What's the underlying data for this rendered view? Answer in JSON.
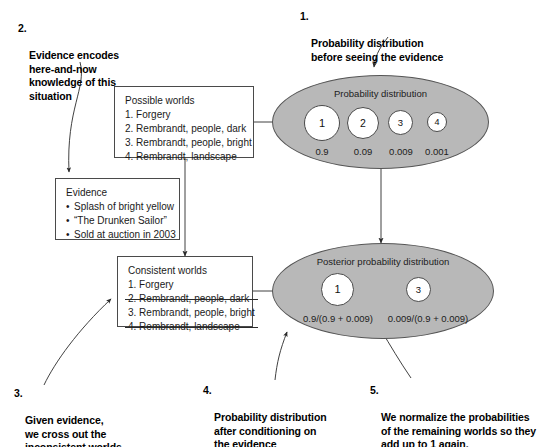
{
  "captions": {
    "c1": {
      "num": "1.",
      "text": "Probability distribution\nbefore seeing the evidence"
    },
    "c2": {
      "num": "2.",
      "text": "Evidence encodes\nhere-and-now\nknowledge of this\nsituation"
    },
    "c3": {
      "num": "3.",
      "text": "Given evidence,\nwe cross out the\ninconsistent worlds."
    },
    "c4": {
      "num": "4.",
      "text": "Probability distribution\nafter conditioning on\nthe evidence"
    },
    "c5": {
      "num": "5.",
      "text": "We normalize the probabilities\nof the remaining worlds so they\nadd up to 1 again."
    }
  },
  "possible_worlds_box": {
    "title": "Possible worlds",
    "items": [
      "1. Forgery",
      "2. Rembrandt, people, dark",
      "3. Rembrandt, people, bright",
      "4. Rembrandt, landscape"
    ]
  },
  "evidence_box": {
    "title": "Evidence",
    "bullet": "•",
    "items": [
      "Splash of bright yellow",
      "“The Drunken Sailor”",
      "Sold at auction in 2003"
    ]
  },
  "consistent_worlds_box": {
    "title": "Consistent worlds",
    "items": [
      {
        "text": "1. Forgery",
        "struck": false
      },
      {
        "text": "2. Rembrandt, people, dark",
        "struck": true
      },
      {
        "text": "3. Rembrandt, people, bright",
        "struck": false
      },
      {
        "text": "4. Rembrandt, landscape",
        "struck": true
      }
    ]
  },
  "prior_ellipse": {
    "title": "Probability distribution",
    "worlds": [
      {
        "label": "1",
        "probability": "0.9"
      },
      {
        "label": "2",
        "probability": "0.09"
      },
      {
        "label": "3",
        "probability": "0.009"
      },
      {
        "label": "4",
        "probability": "0.001"
      }
    ]
  },
  "posterior_ellipse": {
    "title": "Posterior probability distribution",
    "worlds": [
      {
        "label": "1",
        "probability": "0.9/(0.9 + 0.009)"
      },
      {
        "label": "3",
        "probability": "0.009/(0.9 + 0.009)"
      }
    ]
  },
  "colors": {
    "ellipse_fill": "#b8b8b8",
    "ellipse_stroke": "#555555",
    "box_stroke": "#4a4a4a",
    "text": "#1a1a1a",
    "arrow": "#333333",
    "background": "#ffffff"
  },
  "icons": {
    "arrow_down": "arrow-down-icon",
    "arrow_right": "arrow-right-icon",
    "curved_pointer": "curved-pointer-icon"
  }
}
